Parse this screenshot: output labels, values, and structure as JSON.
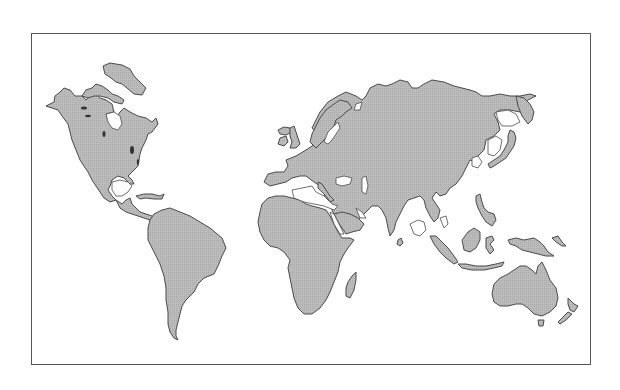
{
  "map": {
    "type": "world-outline-map",
    "projection": "pacific-cut rectangular (Americas left, Eurasia right)",
    "colors": {
      "background": "#ffffff",
      "frame": "#555555",
      "land_fill": "#b9b9b9",
      "land_texture": "#a8a8a8",
      "coastline": "#4a4a4a",
      "water_bodies": "#ffffff"
    },
    "frame": {
      "x": 31,
      "y": 33,
      "width": 560,
      "height": 332
    },
    "regions": [
      {
        "id": "north-america",
        "name": "North America"
      },
      {
        "id": "greenland",
        "name": "Greenland"
      },
      {
        "id": "central-america",
        "name": "Central America"
      },
      {
        "id": "caribbean",
        "name": "Caribbean islands"
      },
      {
        "id": "south-america",
        "name": "South America"
      },
      {
        "id": "europe-asia",
        "name": "Eurasia"
      },
      {
        "id": "british-isles",
        "name": "British Isles"
      },
      {
        "id": "iceland",
        "name": "Iceland"
      },
      {
        "id": "africa",
        "name": "Africa"
      },
      {
        "id": "madagascar",
        "name": "Madagascar"
      },
      {
        "id": "arabia",
        "name": "Arabian Peninsula"
      },
      {
        "id": "india",
        "name": "Indian subcontinent"
      },
      {
        "id": "sri-lanka",
        "name": "Sri Lanka"
      },
      {
        "id": "japan",
        "name": "Japan"
      },
      {
        "id": "southeast-asia-islands",
        "name": "Maritime Southeast Asia"
      },
      {
        "id": "new-guinea",
        "name": "New Guinea"
      },
      {
        "id": "australia",
        "name": "Australia"
      },
      {
        "id": "tasmania",
        "name": "Tasmania"
      },
      {
        "id": "new-zealand",
        "name": "New Zealand"
      }
    ]
  }
}
